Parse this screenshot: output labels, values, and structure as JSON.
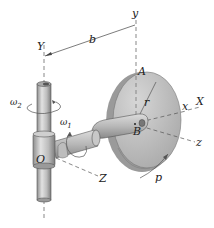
{
  "diagram": {
    "labels": {
      "Y_fixed": "Y",
      "y_rotating": "y",
      "b_dimension": "b",
      "A_point": "A",
      "r_radius": "r",
      "x_axis": "x",
      "X_axis": "X",
      "B_point": "B",
      "z_axis": "z",
      "Z_axis": "Z",
      "O_origin": "O",
      "p_spin": "p",
      "omega1": "ω",
      "omega1_sub": "1",
      "omega2": "ω",
      "omega2_sub": "2"
    },
    "colors": {
      "disk_face": "#bdbdbd",
      "disk_rim": "#9a9a9a",
      "shaft": "#c9c9c9",
      "shaft_shadow": "#8f8f8f",
      "line": "#444444",
      "dash": "#555555"
    }
  }
}
